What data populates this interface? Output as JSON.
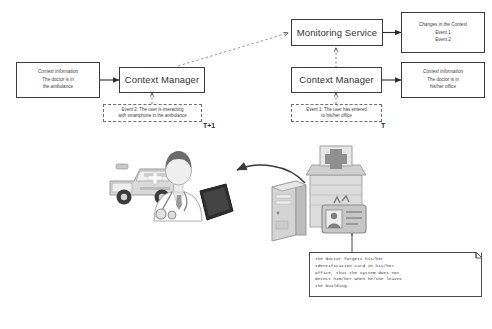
{
  "diagram": {
    "time_labels": {
      "left": "T+1",
      "right": "T"
    },
    "nodes": {
      "monitoring_service": {
        "label": "Monitoring Service"
      },
      "context_manager_left": {
        "label": "Context Manager"
      },
      "context_manager_right": {
        "label": "Context Manager"
      },
      "changes_in_context": {
        "header": "Changes in the Context",
        "line1": "Event 1",
        "line2": "Event 2"
      },
      "context_info_right": {
        "header": "Context Information",
        "line1": "The doctor is in",
        "line2": "his/her office"
      },
      "context_info_left": {
        "header": "Context Information",
        "line1": "The doctor is in",
        "line2": "the ambulance"
      },
      "event_one": {
        "line1": "Event 1: The user has entered",
        "line2": "to his/her office"
      },
      "event_two": {
        "line1": "Event 2: The user is interacting",
        "line2": "with smartphone in the ambulance"
      }
    },
    "note": {
      "text": "The doctor forgets his/her\nidentification card in his/her\noffice, thus the system does not\ndetect him/her when he/she leaves\nthe building."
    },
    "illustrations": {
      "left_scene": "doctor-with-smartphone-and-ambulance",
      "right_scene": "hospital-building-with-server-and-id-badge",
      "transition_arrow": "curved-arrow-pointing-left"
    },
    "colors": {
      "stroke": "#3a3a3a",
      "dashed_stroke": "#6d6d6d",
      "text": "#3c3c3c",
      "background": "#ffffff"
    }
  }
}
